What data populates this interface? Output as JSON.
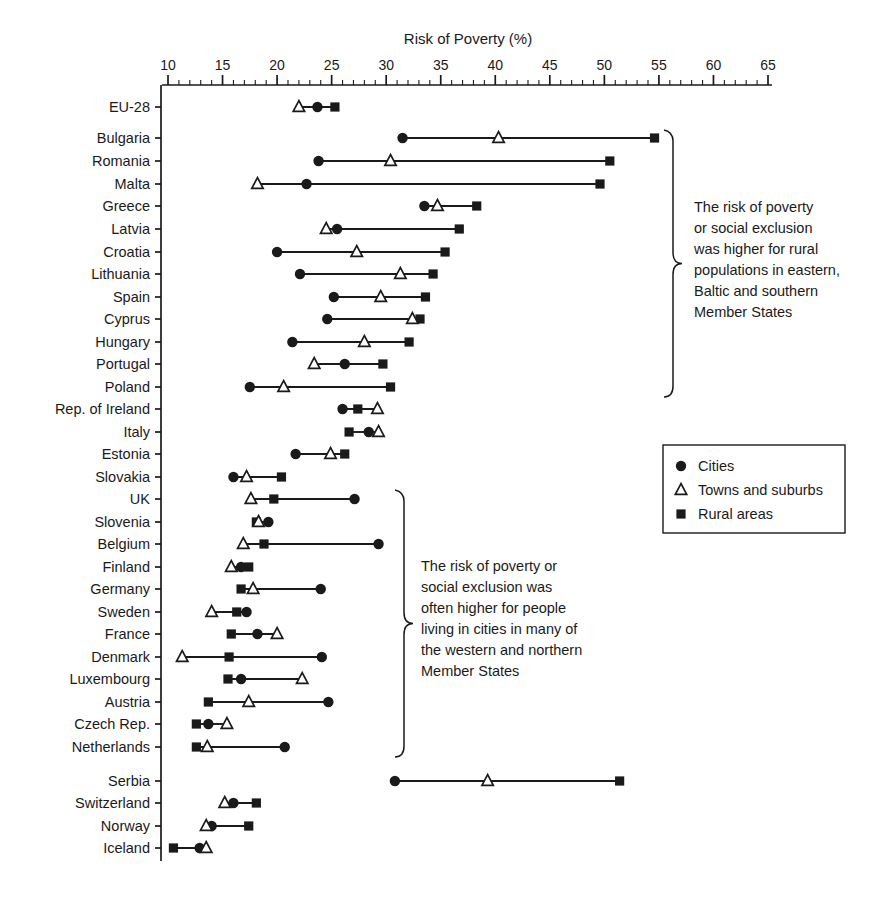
{
  "chart_data": {
    "type": "scatter",
    "title": "Risk of Poverty (%)",
    "xlabel": "Risk of Poverty (%)",
    "ylabel": "",
    "xlim": [
      10,
      65
    ],
    "xticks": [
      10,
      15,
      20,
      25,
      30,
      35,
      40,
      45,
      50,
      55,
      60,
      65
    ],
    "xtick_labels": [
      "10",
      "15",
      "20",
      "25",
      "30",
      "35",
      "40",
      "45",
      "50",
      "55",
      "60",
      "65"
    ],
    "minor_tick_step": 1,
    "grid": false,
    "legend_position": "right",
    "series": [
      {
        "name": "Cities",
        "marker": "filled-circle",
        "key": "cities"
      },
      {
        "name": "Towns and suburbs",
        "marker": "open-triangle",
        "key": "towns"
      },
      {
        "name": "Rural areas",
        "marker": "filled-square",
        "key": "rural"
      }
    ],
    "categories": [
      "EU-28",
      "Bulgaria",
      "Romania",
      "Malta",
      "Greece",
      "Latvia",
      "Croatia",
      "Lithuania",
      "Spain",
      "Cyprus",
      "Hungary",
      "Portugal",
      "Poland",
      "Rep. of Ireland",
      "Italy",
      "Estonia",
      "Slovakia",
      "UK",
      "Slovenia",
      "Belgium",
      "Finland",
      "Germany",
      "Sweden",
      "France",
      "Denmark",
      "Luxembourg",
      "Austria",
      "Czech Rep.",
      "Netherlands",
      "Serbia",
      "Switzerland",
      "Norway",
      "Iceland"
    ],
    "rows": [
      {
        "label": "EU-28",
        "y": 107,
        "gap": false,
        "cities": 23.7,
        "towns": 22.0,
        "rural": 25.3
      },
      {
        "label": "Bulgaria",
        "y": 138,
        "gap": true,
        "cities": 31.5,
        "towns": 40.3,
        "rural": 54.6
      },
      {
        "label": "Romania",
        "y": 161,
        "gap": false,
        "cities": 23.8,
        "towns": 30.4,
        "rural": 50.5
      },
      {
        "label": "Malta",
        "y": 184,
        "gap": false,
        "cities": 22.7,
        "towns": 18.2,
        "rural": 49.6
      },
      {
        "label": "Greece",
        "y": 206,
        "gap": false,
        "cities": 33.5,
        "towns": 34.7,
        "rural": 38.3
      },
      {
        "label": "Latvia",
        "y": 229,
        "gap": false,
        "cities": 25.5,
        "towns": 24.5,
        "rural": 36.7
      },
      {
        "label": "Croatia",
        "y": 252,
        "gap": false,
        "cities": 20.0,
        "towns": 27.3,
        "rural": 35.4
      },
      {
        "label": "Lithuania",
        "y": 274,
        "gap": false,
        "cities": 22.1,
        "towns": 31.3,
        "rural": 34.3
      },
      {
        "label": "Spain",
        "y": 297,
        "gap": false,
        "cities": 25.2,
        "towns": 29.5,
        "rural": 33.6
      },
      {
        "label": "Cyprus",
        "y": 319,
        "gap": false,
        "cities": 24.6,
        "towns": 32.4,
        "rural": 33.1
      },
      {
        "label": "Hungary",
        "y": 342,
        "gap": false,
        "cities": 21.4,
        "towns": 28.0,
        "rural": 32.1
      },
      {
        "label": "Portugal",
        "y": 364,
        "gap": false,
        "cities": 26.2,
        "towns": 23.4,
        "rural": 29.7
      },
      {
        "label": "Poland",
        "y": 387,
        "gap": false,
        "cities": 17.5,
        "towns": 20.6,
        "rural": 30.4
      },
      {
        "label": "Rep. of Ireland",
        "y": 409,
        "gap": false,
        "cities": 26.0,
        "towns": 29.2,
        "rural": 27.4
      },
      {
        "label": "Italy",
        "y": 432,
        "gap": false,
        "cities": 28.4,
        "towns": 29.3,
        "rural": 26.6
      },
      {
        "label": "Estonia",
        "y": 454,
        "gap": false,
        "cities": 21.7,
        "towns": 24.9,
        "rural": 26.2
      },
      {
        "label": "Slovakia",
        "y": 477,
        "gap": false,
        "cities": 16.0,
        "towns": 17.2,
        "rural": 20.4
      },
      {
        "label": "UK",
        "y": 499,
        "gap": false,
        "cities": 27.1,
        "towns": 17.6,
        "rural": 19.7
      },
      {
        "label": "Slovenia",
        "y": 522,
        "gap": false,
        "cities": 19.2,
        "towns": 18.3,
        "rural": 18.1
      },
      {
        "label": "Belgium",
        "y": 544,
        "gap": false,
        "cities": 29.3,
        "towns": 16.9,
        "rural": 18.8
      },
      {
        "label": "Finland",
        "y": 567,
        "gap": false,
        "cities": 16.7,
        "towns": 15.8,
        "rural": 17.4
      },
      {
        "label": "Germany",
        "y": 589,
        "gap": false,
        "cities": 24.0,
        "towns": 17.8,
        "rural": 16.7
      },
      {
        "label": "Sweden",
        "y": 612,
        "gap": false,
        "cities": 17.2,
        "towns": 14.0,
        "rural": 16.3
      },
      {
        "label": "France",
        "y": 634,
        "gap": false,
        "cities": 18.2,
        "towns": 20.0,
        "rural": 15.8
      },
      {
        "label": "Denmark",
        "y": 657,
        "gap": false,
        "cities": 24.1,
        "towns": 11.3,
        "rural": 15.6
      },
      {
        "label": "Luxembourg",
        "y": 679,
        "gap": false,
        "cities": 16.7,
        "towns": 22.3,
        "rural": 15.5
      },
      {
        "label": "Austria",
        "y": 702,
        "gap": false,
        "cities": 24.7,
        "towns": 17.4,
        "rural": 13.7
      },
      {
        "label": "Czech Rep.",
        "y": 724,
        "gap": false,
        "cities": 13.7,
        "towns": 15.4,
        "rural": 12.6
      },
      {
        "label": "Netherlands",
        "y": 747,
        "gap": false,
        "cities": 20.7,
        "towns": 13.6,
        "rural": 12.6
      },
      {
        "label": "Serbia",
        "y": 781,
        "gap": true,
        "cities": 30.8,
        "towns": 39.3,
        "rural": 51.4
      },
      {
        "label": "Switzerland",
        "y": 803,
        "gap": false,
        "cities": 16.0,
        "towns": 15.2,
        "rural": 18.1
      },
      {
        "label": "Norway",
        "y": 826,
        "gap": false,
        "cities": 14.0,
        "towns": 13.5,
        "rural": 17.4
      },
      {
        "label": "Iceland",
        "y": 848,
        "gap": false,
        "cities": 12.9,
        "towns": 13.5,
        "rural": 10.5
      }
    ]
  },
  "legend": {
    "items": [
      {
        "label": "Cities",
        "marker": "filled-circle"
      },
      {
        "label": "Towns and suburbs",
        "marker": "open-triangle"
      },
      {
        "label": "Rural areas",
        "marker": "filled-square"
      }
    ]
  },
  "annotations": [
    {
      "id": "brace-top",
      "lines": [
        "The risk of poverty",
        "or social exclusion",
        "was higher for rural",
        "populations in eastern,",
        "Baltic and southern",
        "Member States"
      ],
      "brace": {
        "x": 673,
        "y1": 130,
        "y2": 397
      },
      "text_x": 694,
      "text_y": 212
    },
    {
      "id": "brace-bottom",
      "lines": [
        "The risk of poverty or",
        "social exclusion was",
        "often higher for people",
        "living in cities in many of",
        "the western and northern",
        "Member States"
      ],
      "brace": {
        "x": 404,
        "y1": 490,
        "y2": 757
      },
      "text_x": 421,
      "text_y": 571
    }
  ],
  "colors": {
    "ink": "#1a1a1a",
    "background": "#ffffff",
    "marker_fill": "#1a1a1a",
    "marker_open_fill": "#ffffff"
  }
}
